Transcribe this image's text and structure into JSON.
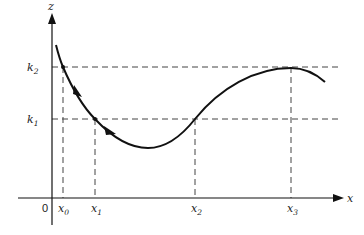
{
  "diagram": {
    "axes": {
      "x_label": "x",
      "z_label": "z",
      "origin_label": "0"
    },
    "levels": [
      {
        "name": "k",
        "sub": "2",
        "y": 67
      },
      {
        "name": "k",
        "sub": "1",
        "y": 119
      }
    ],
    "x_marks": [
      {
        "name": "x",
        "sub": "0",
        "x": 63
      },
      {
        "name": "x",
        "sub": "1",
        "x": 95
      },
      {
        "name": "x",
        "sub": "2",
        "x": 195
      },
      {
        "name": "x",
        "sub": "3",
        "x": 291
      }
    ],
    "curve": {
      "description": "Smooth curve descending from above k2 through (x0,k2) and (x1,k1) to a minimum, rising through (x2,k1) to a maximum at (x3,k2), then turning down",
      "arrows": [
        "direction arrow between x0 and x1",
        "direction arrow just after x1"
      ]
    },
    "colors": {
      "line": "#111111",
      "dash": "#444444",
      "background": "#ffffff"
    }
  }
}
